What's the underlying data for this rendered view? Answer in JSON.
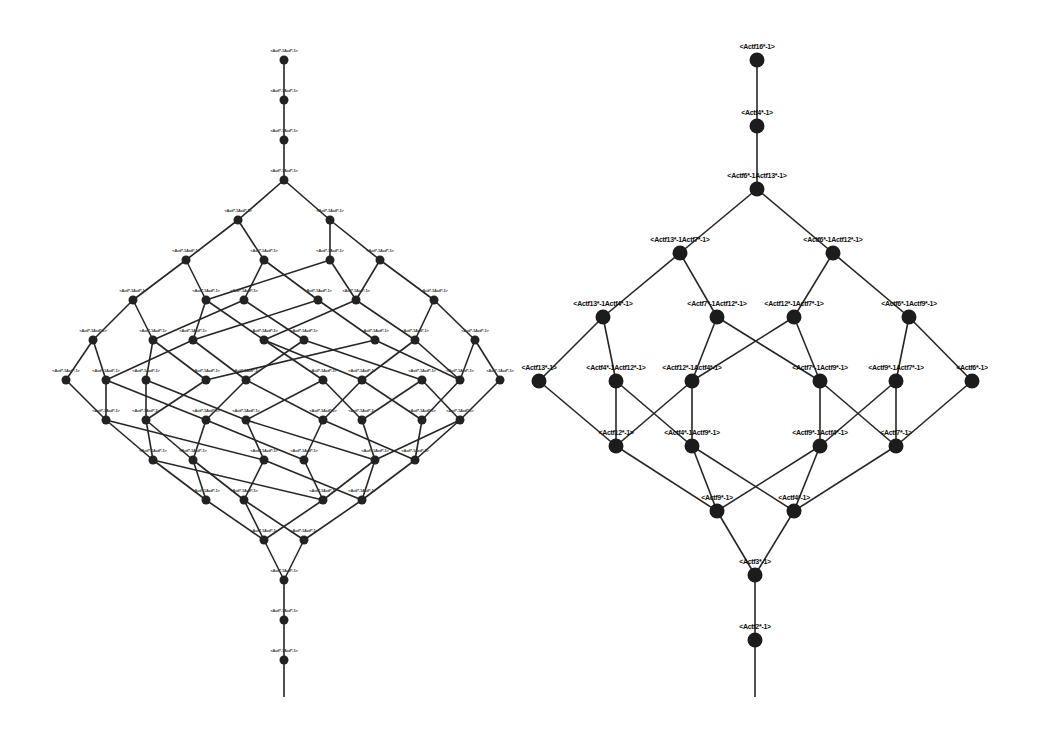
{
  "figure": {
    "left_graph": {
      "name": "dense-lattice",
      "label_text": "<Actf*-1Actf*-1>",
      "rows": [
        {
          "nodes": [
            {
              "id": "a0"
            }
          ]
        },
        {
          "nodes": [
            {
              "id": "a1"
            }
          ]
        },
        {
          "nodes": [
            {
              "id": "a2"
            }
          ]
        },
        {
          "nodes": [
            {
              "id": "a3"
            }
          ]
        },
        {
          "nodes": [
            {
              "id": "b0"
            },
            {
              "id": "b1"
            }
          ]
        },
        {
          "nodes": [
            {
              "id": "c0"
            },
            {
              "id": "c1"
            },
            {
              "id": "c2"
            },
            {
              "id": "c3"
            }
          ]
        },
        {
          "nodes": [
            {
              "id": "d0"
            },
            {
              "id": "d1"
            },
            {
              "id": "d2"
            },
            {
              "id": "d3"
            },
            {
              "id": "d4"
            },
            {
              "id": "d5"
            }
          ]
        },
        {
          "nodes": [
            {
              "id": "e0"
            },
            {
              "id": "e1"
            },
            {
              "id": "e2"
            },
            {
              "id": "e3"
            },
            {
              "id": "e4"
            },
            {
              "id": "e5"
            },
            {
              "id": "e6"
            },
            {
              "id": "e7"
            }
          ]
        },
        {
          "nodes": [
            {
              "id": "f0"
            },
            {
              "id": "f1"
            },
            {
              "id": "f2"
            },
            {
              "id": "f3"
            },
            {
              "id": "f4"
            },
            {
              "id": "f5"
            },
            {
              "id": "f6"
            },
            {
              "id": "f7"
            },
            {
              "id": "f8"
            },
            {
              "id": "f9"
            }
          ]
        },
        {
          "nodes": [
            {
              "id": "g0"
            },
            {
              "id": "g1"
            },
            {
              "id": "g2"
            },
            {
              "id": "g3"
            },
            {
              "id": "g4"
            },
            {
              "id": "g5"
            },
            {
              "id": "g6"
            },
            {
              "id": "g7"
            }
          ]
        },
        {
          "nodes": [
            {
              "id": "h0"
            },
            {
              "id": "h1"
            },
            {
              "id": "h2"
            },
            {
              "id": "h3"
            },
            {
              "id": "h4"
            },
            {
              "id": "h5"
            }
          ]
        },
        {
          "nodes": [
            {
              "id": "i0"
            },
            {
              "id": "i1"
            },
            {
              "id": "i2"
            },
            {
              "id": "i3"
            }
          ]
        },
        {
          "nodes": [
            {
              "id": "j0"
            },
            {
              "id": "j1"
            }
          ]
        },
        {
          "nodes": [
            {
              "id": "k0"
            }
          ]
        },
        {
          "nodes": [
            {
              "id": "k1"
            }
          ]
        },
        {
          "nodes": [
            {
              "id": "k2"
            }
          ]
        }
      ],
      "edges": [
        [
          "a0",
          "a1"
        ],
        [
          "a1",
          "a2"
        ],
        [
          "a2",
          "a3"
        ],
        [
          "a3",
          "b0"
        ],
        [
          "a3",
          "b1"
        ],
        [
          "b0",
          "c0"
        ],
        [
          "b0",
          "c1"
        ],
        [
          "b1",
          "c2"
        ],
        [
          "b1",
          "c3"
        ],
        [
          "c0",
          "d0"
        ],
        [
          "c0",
          "d1"
        ],
        [
          "c1",
          "d2"
        ],
        [
          "c1",
          "d3"
        ],
        [
          "c2",
          "d1"
        ],
        [
          "c2",
          "d4"
        ],
        [
          "c3",
          "d4"
        ],
        [
          "c3",
          "d5"
        ],
        [
          "d0",
          "e0"
        ],
        [
          "d0",
          "e1"
        ],
        [
          "d1",
          "e2"
        ],
        [
          "d1",
          "e3"
        ],
        [
          "d2",
          "e1"
        ],
        [
          "d2",
          "e4"
        ],
        [
          "d3",
          "e2"
        ],
        [
          "d3",
          "e5"
        ],
        [
          "d4",
          "e3"
        ],
        [
          "d4",
          "e6"
        ],
        [
          "d5",
          "e6"
        ],
        [
          "d5",
          "e7"
        ],
        [
          "e0",
          "f0"
        ],
        [
          "e0",
          "f1"
        ],
        [
          "e1",
          "f2"
        ],
        [
          "e1",
          "f3"
        ],
        [
          "e2",
          "f1"
        ],
        [
          "e2",
          "f4"
        ],
        [
          "e3",
          "f5"
        ],
        [
          "e3",
          "f6"
        ],
        [
          "e4",
          "f4"
        ],
        [
          "e4",
          "f7"
        ],
        [
          "e5",
          "f3"
        ],
        [
          "e5",
          "f8"
        ],
        [
          "e6",
          "f6"
        ],
        [
          "e6",
          "f8"
        ],
        [
          "e7",
          "f8"
        ],
        [
          "e7",
          "f9"
        ],
        [
          "f0",
          "g0"
        ],
        [
          "f1",
          "g0"
        ],
        [
          "f1",
          "g2"
        ],
        [
          "f2",
          "g1"
        ],
        [
          "f2",
          "g3"
        ],
        [
          "f3",
          "g1"
        ],
        [
          "f4",
          "g2"
        ],
        [
          "f4",
          "g4"
        ],
        [
          "f5",
          "g3"
        ],
        [
          "f5",
          "g5"
        ],
        [
          "f6",
          "g4"
        ],
        [
          "f6",
          "g6"
        ],
        [
          "f7",
          "g5"
        ],
        [
          "f7",
          "g7"
        ],
        [
          "f8",
          "g6"
        ],
        [
          "f9",
          "g7"
        ],
        [
          "g0",
          "h0"
        ],
        [
          "g0",
          "h2"
        ],
        [
          "g1",
          "h0"
        ],
        [
          "g1",
          "h1"
        ],
        [
          "g2",
          "h1"
        ],
        [
          "g2",
          "h3"
        ],
        [
          "g3",
          "h2"
        ],
        [
          "g3",
          "h4"
        ],
        [
          "g4",
          "h3"
        ],
        [
          "g4",
          "h5"
        ],
        [
          "g5",
          "h4"
        ],
        [
          "g6",
          "h5"
        ],
        [
          "g7",
          "h5"
        ],
        [
          "g7",
          "h4"
        ],
        [
          "h0",
          "i0"
        ],
        [
          "h0",
          "i2"
        ],
        [
          "h1",
          "i0"
        ],
        [
          "h1",
          "i1"
        ],
        [
          "h2",
          "i1"
        ],
        [
          "h2",
          "i3"
        ],
        [
          "h3",
          "i2"
        ],
        [
          "h4",
          "i2"
        ],
        [
          "h4",
          "i3"
        ],
        [
          "h5",
          "i3"
        ],
        [
          "i0",
          "j0"
        ],
        [
          "i1",
          "j0"
        ],
        [
          "i1",
          "j1"
        ],
        [
          "i2",
          "j0"
        ],
        [
          "i3",
          "j1"
        ],
        [
          "j0",
          "k0"
        ],
        [
          "j1",
          "k0"
        ],
        [
          "k0",
          "k1"
        ],
        [
          "k1",
          "k2"
        ]
      ]
    },
    "right_graph": {
      "name": "reduced-lattice",
      "rows": [
        {
          "nodes": [
            {
              "id": "R0",
              "label": "<Actf16*-1>"
            }
          ]
        },
        {
          "nodes": [
            {
              "id": "R1",
              "label": "<Actf4*-1>"
            }
          ]
        },
        {
          "nodes": [
            {
              "id": "R2",
              "label": "<Actf6*-1Actf13*-1>"
            }
          ]
        },
        {
          "nodes": [
            {
              "id": "R3",
              "label": "<Actf13*-1Actf7*-1>"
            },
            {
              "id": "R4",
              "label": "<Actf6*-1Actf12*-1>"
            }
          ]
        },
        {
          "nodes": [
            {
              "id": "R5",
              "label": "<Actf13*-1Actf4*-1>"
            },
            {
              "id": "R6",
              "label": "<Actf7*-1Actf12*-1>"
            },
            {
              "id": "R7",
              "label": "<Actf12*-1Actf7*-1>"
            },
            {
              "id": "R8",
              "label": "<Actf6*-1Actf9*-1>"
            }
          ]
        },
        {
          "nodes": [
            {
              "id": "R9",
              "label": "<Actf13*-1>"
            },
            {
              "id": "R10",
              "label": "<Actf4*-1Actf12*-1>"
            },
            {
              "id": "R11",
              "label": "<Actf12*-1Actf4*-1>"
            },
            {
              "id": "R12",
              "label": "<Actf7*-1Actf9*-1>"
            },
            {
              "id": "R13",
              "label": "<Actf9*-1Actf7*-1>"
            },
            {
              "id": "R14",
              "label": "<Actf6*-1>"
            }
          ]
        },
        {
          "nodes": [
            {
              "id": "R15",
              "label": "<Actf12*-1>"
            },
            {
              "id": "R16",
              "label": "<Actf4*-1Actf9*-1>"
            },
            {
              "id": "R17",
              "label": "<Actf9*-1Actf4*-1>"
            },
            {
              "id": "R18",
              "label": "<Actf7*-1>"
            }
          ]
        },
        {
          "nodes": [
            {
              "id": "R19",
              "label": "<Actf9*-1>"
            },
            {
              "id": "R20",
              "label": "<Actf4*-1>"
            }
          ]
        },
        {
          "nodes": [
            {
              "id": "R21",
              "label": "<Actf3*-1>"
            }
          ]
        },
        {
          "nodes": [
            {
              "id": "R22",
              "label": "<Actf2*-1>"
            }
          ]
        }
      ],
      "edges": [
        [
          "R0",
          "R1"
        ],
        [
          "R1",
          "R2"
        ],
        [
          "R2",
          "R3"
        ],
        [
          "R2",
          "R4"
        ],
        [
          "R3",
          "R5"
        ],
        [
          "R3",
          "R6"
        ],
        [
          "R4",
          "R7"
        ],
        [
          "R4",
          "R8"
        ],
        [
          "R5",
          "R9"
        ],
        [
          "R5",
          "R10"
        ],
        [
          "R6",
          "R11"
        ],
        [
          "R6",
          "R12"
        ],
        [
          "R7",
          "R11"
        ],
        [
          "R7",
          "R12"
        ],
        [
          "R8",
          "R13"
        ],
        [
          "R8",
          "R14"
        ],
        [
          "R9",
          "R15"
        ],
        [
          "R10",
          "R15"
        ],
        [
          "R10",
          "R16"
        ],
        [
          "R11",
          "R15"
        ],
        [
          "R11",
          "R16"
        ],
        [
          "R12",
          "R17"
        ],
        [
          "R12",
          "R18"
        ],
        [
          "R13",
          "R17"
        ],
        [
          "R13",
          "R18"
        ],
        [
          "R14",
          "R18"
        ],
        [
          "R15",
          "R19"
        ],
        [
          "R16",
          "R19"
        ],
        [
          "R16",
          "R20"
        ],
        [
          "R17",
          "R19"
        ],
        [
          "R17",
          "R20"
        ],
        [
          "R18",
          "R20"
        ],
        [
          "R19",
          "R21"
        ],
        [
          "R20",
          "R21"
        ],
        [
          "R21",
          "R22"
        ]
      ]
    }
  }
}
